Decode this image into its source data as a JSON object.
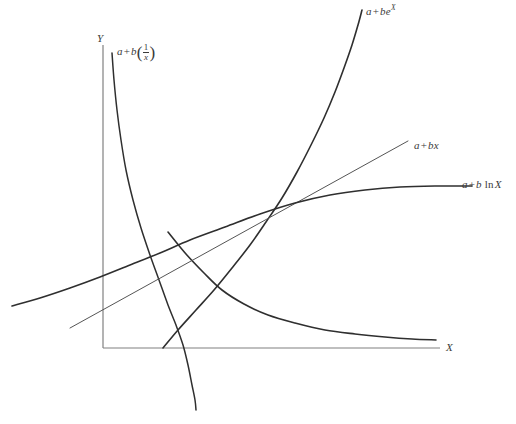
{
  "figure": {
    "background_color": "#ffffff",
    "axis_color": "#808080",
    "curve_color": "#2f2f2f",
    "line_color": "#555555",
    "text_color": "#3a3a3a"
  },
  "axes": {
    "y_label": "Y",
    "x_label": "X",
    "origin": {
      "x": 103,
      "y": 348
    },
    "x_axis_end": {
      "x": 440,
      "y": 348
    },
    "y_axis_top": {
      "x": 103,
      "y": 45
    }
  },
  "labels": {
    "reciprocal": {
      "prefix": "a",
      "operator": "+",
      "coefficient": "b",
      "numerator": "1",
      "denominator": "x",
      "plain": "a + b(1/x)"
    },
    "exponential": {
      "prefix": "a",
      "operator": "+",
      "coefficient": "b",
      "base": "e",
      "exponent": "X",
      "plain": "a + be^X"
    },
    "linear": {
      "prefix": "a",
      "operator": "+",
      "coefficient": "b",
      "variable": "x",
      "plain": "a + bx"
    },
    "logarithmic": {
      "prefix": "a",
      "operator": "+",
      "coefficient": "b",
      "function": "ln",
      "variable": "X",
      "plain": "a + b ln X"
    }
  },
  "chart_data": {
    "type": "line",
    "title": "",
    "xlabel": "X",
    "ylabel": "Y",
    "grid": false,
    "legend": "inline-curve-end-labels",
    "xlim": [
      0,
      516
    ],
    "ylim": [
      424,
      0
    ],
    "note": "Schematic plot in pixel coordinates; four regression functional forms drawn as smooth curves.",
    "series": [
      {
        "name": "a + b(1/x)",
        "form": "reciprocal",
        "color": "#2f2f2f",
        "width": 1.5,
        "label_position": {
          "x": 117,
          "y": 44
        },
        "points": [
          [
            112,
            53
          ],
          [
            114,
            80
          ],
          [
            117,
            110
          ],
          [
            121,
            140
          ],
          [
            126,
            170
          ],
          [
            133,
            200
          ],
          [
            141,
            228
          ],
          [
            150,
            255
          ],
          [
            159,
            280
          ],
          [
            168,
            305
          ],
          [
            176,
            325
          ],
          [
            183,
            345
          ],
          [
            188,
            365
          ],
          [
            192,
            385
          ],
          [
            195,
            400
          ],
          [
            196,
            410
          ]
        ]
      },
      {
        "name": "a + be^X",
        "form": "exponential",
        "color": "#2f2f2f",
        "width": 1.6,
        "label_position": {
          "x": 362,
          "y": 5
        },
        "points": [
          [
            163,
            348
          ],
          [
            178,
            330
          ],
          [
            196,
            310
          ],
          [
            214,
            290
          ],
          [
            232,
            268
          ],
          [
            250,
            245
          ],
          [
            266,
            222
          ],
          [
            282,
            198
          ],
          [
            297,
            172
          ],
          [
            311,
            145
          ],
          [
            324,
            118
          ],
          [
            335,
            92
          ],
          [
            344,
            68
          ],
          [
            352,
            45
          ],
          [
            358,
            25
          ],
          [
            362,
            10
          ]
        ]
      },
      {
        "name": "a + bx",
        "form": "linear",
        "color": "#555555",
        "width": 1.0,
        "label_position": {
          "x": 412,
          "y": 139
        },
        "points": [
          [
            70,
            328
          ],
          [
            408,
            141
          ]
        ]
      },
      {
        "name": "a + b ln X",
        "form": "logarithmic",
        "color": "#2f2f2f",
        "width": 1.6,
        "label_position": {
          "x": 462,
          "y": 178
        },
        "points": [
          [
            12,
            306
          ],
          [
            40,
            298
          ],
          [
            70,
            288
          ],
          [
            100,
            277
          ],
          [
            130,
            265
          ],
          [
            160,
            253
          ],
          [
            190,
            240
          ],
          [
            225,
            227
          ],
          [
            260,
            214
          ],
          [
            295,
            203
          ],
          [
            330,
            195
          ],
          [
            365,
            190
          ],
          [
            400,
            187
          ],
          [
            435,
            186
          ],
          [
            472,
            186
          ]
        ]
      },
      {
        "name": "a + b(1/x) right branch",
        "form": "reciprocal-tail",
        "color": "#2f2f2f",
        "width": 1.6,
        "label_position": null,
        "points": [
          [
            168,
            232
          ],
          [
            186,
            254
          ],
          [
            204,
            273
          ],
          [
            222,
            290
          ],
          [
            244,
            304
          ],
          [
            268,
            315
          ],
          [
            295,
            323
          ],
          [
            325,
            330
          ],
          [
            355,
            334
          ],
          [
            385,
            337
          ],
          [
            412,
            339
          ],
          [
            436,
            340
          ]
        ]
      }
    ]
  }
}
